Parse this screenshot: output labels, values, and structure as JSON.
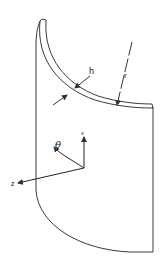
{
  "diagram": {
    "type": "cylindrical-shell-segment",
    "labels": {
      "thickness": "h",
      "radius": "r",
      "angle": "θ",
      "axis_x": "x",
      "axis_z": "z"
    },
    "colors": {
      "stroke": "#3a3a3a",
      "background": "#ffffff"
    }
  }
}
